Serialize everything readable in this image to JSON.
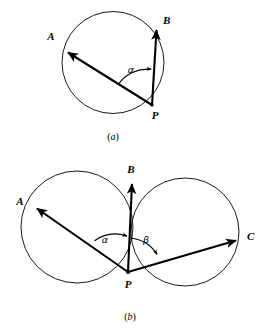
{
  "figure": {
    "background_color": "#ffffff",
    "stroke_color": "#000000",
    "circle_color": "#1a1a1a",
    "panels": [
      {
        "id": "panel-a",
        "caption": "(a)",
        "caption_open": "(",
        "caption_letter": "a",
        "caption_close": ")",
        "description": "Single circle through points A, B and P with vectors PA and PB and angle alpha between them",
        "circles": [
          {
            "name": "circle-a",
            "cx": 113,
            "cy": 62.5,
            "r": 51
          }
        ],
        "points": [
          {
            "label": "A",
            "x": 64,
            "y": 49,
            "label_x": 51,
            "label_y": 40
          },
          {
            "label": "B",
            "x": 157,
            "y": 25,
            "label_x": 163,
            "label_y": 24
          },
          {
            "label": "P",
            "x": 152,
            "y": 105,
            "label_x": 155,
            "label_y": 119
          }
        ],
        "vectors": [
          {
            "name": "vector-PA",
            "from": "P",
            "to": "A",
            "x1": 152,
            "y1": 105,
            "x2": 66,
            "y2": 51
          },
          {
            "name": "vector-PB",
            "from": "P",
            "to": "B",
            "x1": 152,
            "y1": 105,
            "x2": 156,
            "y2": 28
          }
        ],
        "angles": [
          {
            "label": "α",
            "name": "alpha",
            "label_x": 131,
            "label_y": 73,
            "arc_center_x": 152,
            "arc_center_y": 105,
            "arc_radius": 36
          }
        ]
      },
      {
        "id": "panel-b",
        "caption": "(b)",
        "caption_open": "(",
        "caption_letter": "b",
        "caption_close": ")",
        "description": "Two intersecting circles meeting at B and P, with vectors PA, PB, PC and angles alpha and beta",
        "circles": [
          {
            "name": "circle-left",
            "cx": 77,
            "cy": 227,
            "r": 56
          },
          {
            "name": "circle-right",
            "cx": 185,
            "cy": 232,
            "r": 54
          }
        ],
        "points": [
          {
            "label": "A",
            "x": 33,
            "y": 206,
            "label_x": 20,
            "label_y": 205
          },
          {
            "label": "B",
            "x": 133,
            "y": 179,
            "label_x": 131,
            "label_y": 173
          },
          {
            "label": "C",
            "x": 240,
            "y": 239,
            "label_x": 247,
            "label_y": 240
          },
          {
            "label": "P",
            "x": 128,
            "y": 272,
            "label_x": 128,
            "label_y": 288
          }
        ],
        "vectors": [
          {
            "name": "vector-PA",
            "from": "P",
            "to": "A",
            "x1": 128,
            "y1": 272,
            "x2": 35,
            "y2": 207
          },
          {
            "name": "vector-PB",
            "from": "P",
            "to": "B",
            "x1": 128,
            "y1": 272,
            "x2": 132,
            "y2": 182
          },
          {
            "name": "vector-PC",
            "from": "P",
            "to": "C",
            "x1": 128,
            "y1": 272,
            "x2": 238,
            "y2": 240
          }
        ],
        "angles": [
          {
            "label": "α",
            "name": "alpha",
            "label_x": 105,
            "label_y": 243,
            "arc_center_x": 128,
            "arc_center_y": 272,
            "arc_radius": 36
          },
          {
            "label": "β",
            "name": "beta",
            "label_x": 146,
            "label_y": 243,
            "arc_center_x": 128,
            "arc_center_y": 272,
            "arc_radius": 34
          }
        ]
      }
    ]
  }
}
